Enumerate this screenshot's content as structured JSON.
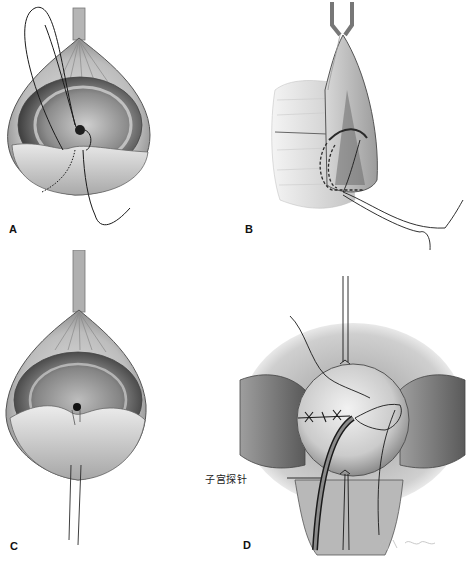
{
  "figure": {
    "panels": [
      {
        "id": "A",
        "label": "A",
        "description": "Bladder-like tissue sac held by instrument, purse-string suture placed around central opening"
      },
      {
        "id": "B",
        "label": "B",
        "description": "Side view of sac held by forceps, curved needle passing through tissue wall with dashed path"
      },
      {
        "id": "C",
        "label": "C",
        "description": "Sac held from top with instrument, central opening drawn closed, two threads trailing below"
      },
      {
        "id": "D",
        "label": "D",
        "description": "Closed dome with interrupted X sutures, traction sutures top and bottom, probe inserted"
      }
    ],
    "callouts": [
      {
        "panel": "D",
        "text": "子宫探针"
      }
    ],
    "signature": "artist signature (illegible)",
    "colors": {
      "background": "#ffffff",
      "tissue_light": "#d9d9d9",
      "tissue_mid": "#a8a8a8",
      "tissue_dark": "#4a4a4a",
      "line": "#1a1a1a"
    }
  }
}
